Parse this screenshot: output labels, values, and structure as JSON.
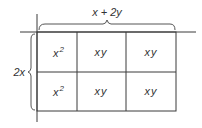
{
  "diagram": {
    "top_label": "x + 2y",
    "left_label": "2x",
    "rows": [
      [
        {
          "base": "x",
          "exp": "2"
        },
        {
          "base": "xy",
          "exp": ""
        },
        {
          "base": "xy",
          "exp": ""
        }
      ],
      [
        {
          "base": "x",
          "exp": "2"
        },
        {
          "base": "xy",
          "exp": ""
        },
        {
          "base": "xy",
          "exp": ""
        }
      ]
    ]
  }
}
